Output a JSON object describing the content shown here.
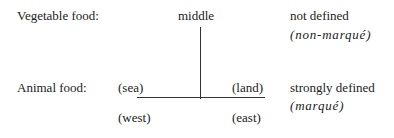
{
  "rows": {
    "vegetable": {
      "label": "Vegetable food:",
      "axis_label": "middle",
      "definition": "not defined",
      "term": "(non-marqué)"
    },
    "animal": {
      "label": "Animal food:",
      "left_label": "(sea)",
      "right_label": "(land)",
      "bottom_left_label": "(west)",
      "bottom_right_label": "(east)",
      "definition": "strongly defined",
      "term": "(marqué)"
    }
  }
}
